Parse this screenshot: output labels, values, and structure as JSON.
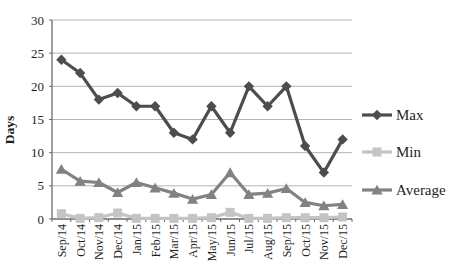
{
  "chart_data": {
    "type": "line",
    "title": "",
    "xlabel": "",
    "ylabel": "Days",
    "ylim": [
      0,
      30
    ],
    "yticks": [
      0,
      5,
      10,
      15,
      20,
      25,
      30
    ],
    "grid": true,
    "legend_position": "right",
    "categories": [
      "Sep/14",
      "Oct/14",
      "Nov/14",
      "Dec/14",
      "Jan/15",
      "Feb/15",
      "Mar/15",
      "Apr/15",
      "May/15",
      "Jun/15",
      "Jul/15",
      "Aug/15",
      "Sep/15",
      "Oct/15",
      "Nov/15",
      "Dec/15"
    ],
    "series": [
      {
        "name": "Max",
        "marker": "diamond",
        "color": "#4d4d4d",
        "values": [
          24,
          22,
          18,
          19,
          17,
          17,
          13,
          12,
          17,
          13,
          20,
          17,
          20,
          11,
          7,
          12
        ]
      },
      {
        "name": "Min",
        "marker": "square",
        "color": "#c4c4c4",
        "values": [
          0.8,
          0.1,
          0.2,
          0.9,
          0.1,
          0.1,
          0.1,
          0.1,
          0.2,
          1.0,
          0.1,
          0.1,
          0.2,
          0.2,
          0.2,
          0.3
        ]
      },
      {
        "name": "Average",
        "marker": "triangle",
        "color": "#828282",
        "values": [
          7.5,
          5.7,
          5.5,
          4.0,
          5.5,
          4.7,
          3.9,
          3.0,
          3.7,
          7.0,
          3.7,
          3.9,
          4.6,
          2.5,
          2.0,
          2.2
        ]
      }
    ],
    "colors": {
      "gridline": "#b4b4b4",
      "axis": "#6b6b6b",
      "text": "#1f1f1f"
    }
  }
}
